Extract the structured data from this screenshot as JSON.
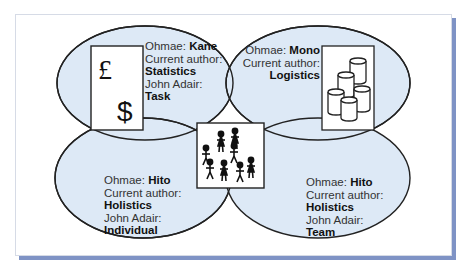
{
  "colors": {
    "ellipse_fill": "#dde9f6",
    "ellipse_stroke": "#222222",
    "frame_shadow": "#7f93c5",
    "box_fill": "#ffffff"
  },
  "quadrants": {
    "top_left": {
      "ohmae_label": "Ohmae:",
      "ohmae_value": "Kane",
      "current_label": "Current author:",
      "current_value": "Statistics",
      "adair_label": "John Adair:",
      "adair_value": "Task",
      "icon": "currency-icon",
      "glyphs": [
        "£",
        "$"
      ]
    },
    "top_right": {
      "ohmae_label": "Ohmae:",
      "ohmae_value": "Mono",
      "current_label": "Current author:",
      "current_value": "Logistics",
      "icon": "barrels-icon"
    },
    "bottom_left": {
      "ohmae_label": "Ohmae:",
      "ohmae_value": "Hito",
      "current_label": "Current author:",
      "current_value": "Holistics",
      "adair_label": "John Adair:",
      "adair_value": "Individual"
    },
    "bottom_right": {
      "ohmae_label": "Ohmae:",
      "ohmae_value": "Hito",
      "current_label": "Current author:",
      "current_value": "Holistics",
      "adair_label": "John Adair:",
      "adair_value": "Team"
    },
    "center": {
      "icon": "people-group-icon"
    }
  }
}
